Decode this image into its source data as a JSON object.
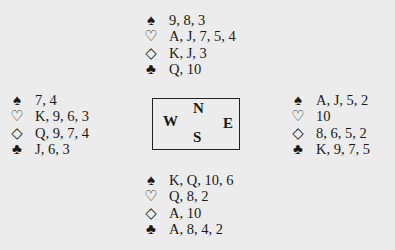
{
  "hands": {
    "north": {
      "spades": "9, 8, 3",
      "hearts": "A, J, 7, 5, 4",
      "diamonds": "K, J, 3",
      "clubs": "Q, 10"
    },
    "west": {
      "spades": "7, 4",
      "hearts": "K, 9, 6, 3",
      "diamonds": "Q, 9, 7, 4",
      "clubs": "J, 6, 3"
    },
    "east": {
      "spades": "A, J, 5, 2",
      "hearts": "10",
      "diamonds": "8, 6, 5, 2",
      "clubs": "K, 9, 7, 5"
    },
    "south": {
      "spades": "K, Q, 10, 6",
      "hearts": "Q, 8, 2",
      "diamonds": "A, 10",
      "clubs": "A, 8, 4, 2"
    }
  },
  "suits": {
    "spades": "♠",
    "hearts": "♡",
    "diamonds": "◇",
    "clubs": "♣"
  },
  "compass": {
    "north": "N",
    "west": "W",
    "east": "E",
    "south": "S"
  }
}
